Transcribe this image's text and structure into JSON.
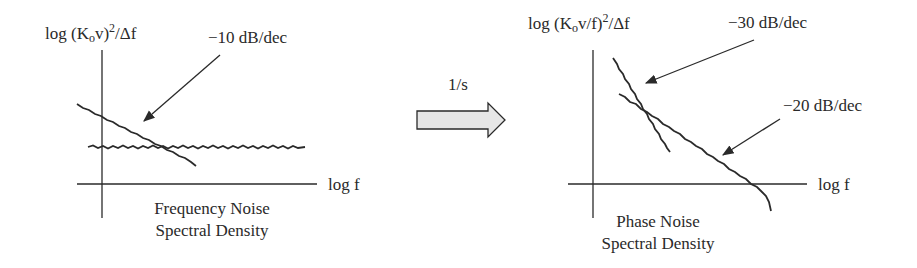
{
  "left_panel": {
    "ylabel": {
      "prefix": "log (K",
      "sub": "o",
      "mid": "v)",
      "sup": "2",
      "suffix": "/Δf"
    },
    "xlabel": "log f",
    "slope_label": "−10 dB/dec",
    "caption_line1": "Frequency Noise",
    "caption_line2": "Spectral Density"
  },
  "transform": {
    "label": "1/s",
    "arrow_fill": "#e6e6e6"
  },
  "right_panel": {
    "ylabel": {
      "prefix": "log (K",
      "sub": "o",
      "mid": "v/f)",
      "sup": "2",
      "suffix": "/Δf"
    },
    "xlabel": "log f",
    "slope_label_1": "−30 dB/dec",
    "slope_label_2": "−20 dB/dec",
    "caption_line1": "Phase Noise",
    "caption_line2": "Spectral Density"
  },
  "colors": {
    "line": "#2a2a2a",
    "background": "#ffffff"
  }
}
